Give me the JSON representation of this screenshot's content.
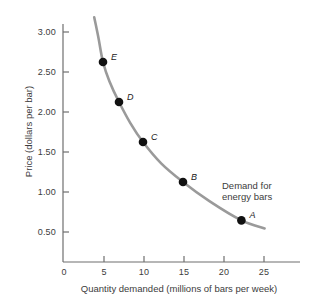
{
  "chart_data": {
    "type": "line",
    "title": "",
    "xlabel": "Quantity demanded (millions of bars per week)",
    "ylabel": "Price (dollars per bar)",
    "xlim": [
      0,
      28
    ],
    "ylim": [
      0,
      3.2
    ],
    "xticks": [
      "0",
      "5",
      "10",
      "15",
      "20",
      "25"
    ],
    "xtick_values": [
      0,
      5,
      10,
      15,
      20,
      25
    ],
    "yticks": [
      "0.50",
      "1.00",
      "1.50",
      "2.00",
      "2.50",
      "3.00"
    ],
    "ytick_values": [
      0.5,
      1.0,
      1.5,
      2.0,
      2.5,
      3.0
    ],
    "grid": false,
    "legend_position": "none",
    "annotations": [
      {
        "name": "demand-curve-annotation",
        "line1": "Demand for",
        "line2": "energy bars"
      }
    ],
    "series": [
      {
        "name": "Demand for energy bars",
        "color": "#9a9a9a",
        "linewidth": 2.6,
        "curve_x": [
          3.9,
          4.4,
          5.0,
          5.8,
          7.0,
          8.4,
          10.0,
          12.3,
          15.0,
          18.3,
          22.3,
          25.2
        ],
        "curve_y": [
          3.06,
          2.82,
          2.5,
          2.26,
          2.0,
          1.74,
          1.5,
          1.23,
          1.0,
          0.76,
          0.52,
          0.42
        ],
        "points": [
          {
            "label": "E",
            "x": 5.0,
            "y": 2.5
          },
          {
            "label": "D",
            "x": 7.0,
            "y": 2.0
          },
          {
            "label": "C",
            "x": 10.0,
            "y": 1.5
          },
          {
            "label": "B",
            "x": 15.0,
            "y": 1.0
          },
          {
            "label": "A",
            "x": 22.3,
            "y": 0.52
          }
        ]
      }
    ],
    "colors": {
      "curve": "#9a9a9a",
      "point": "#111111",
      "axis": "#6f6f6f",
      "text": "#3c3c3c"
    }
  }
}
